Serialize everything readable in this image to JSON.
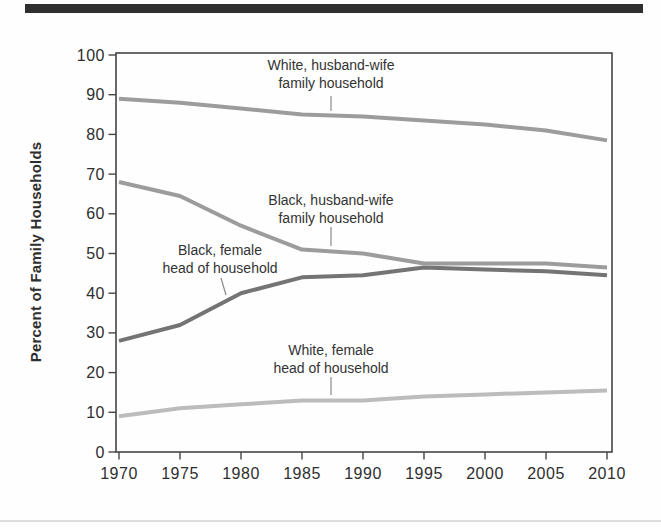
{
  "page": {
    "background": "#fefefe",
    "top_bar_color": "#2f2f2f",
    "bottom_rule_color": "#dddddd"
  },
  "chart_data": {
    "type": "line",
    "title": "",
    "xlabel": "",
    "ylabel": "Percent of Family Households",
    "xlim": [
      1970,
      2010
    ],
    "ylim": [
      0,
      100
    ],
    "grid": false,
    "legend": "inline-labels-with-leader-lines",
    "x": [
      1970,
      1975,
      1980,
      1985,
      1990,
      1995,
      2000,
      2005,
      2010
    ],
    "x_tick_labels": [
      "1970",
      "1975",
      "1980",
      "1985",
      "1990",
      "1995",
      "2000",
      "2005",
      "2010"
    ],
    "y_ticks": [
      0,
      10,
      20,
      30,
      40,
      50,
      60,
      70,
      80,
      90,
      100
    ],
    "y_tick_labels": [
      "0",
      "10",
      "20",
      "30",
      "40",
      "50",
      "60",
      "70",
      "80",
      "90",
      "100"
    ],
    "axis_color": "#454545",
    "text_color": "#2e2e2e",
    "leader_color": "#8a8a8a",
    "series": [
      {
        "name": "White, husband-wife family household",
        "label_lines": [
          "White, husband-wife",
          "family household"
        ],
        "color": "#9c9c9c",
        "values": [
          89,
          88,
          86.5,
          85,
          84.5,
          83.5,
          82.5,
          81,
          78.5
        ]
      },
      {
        "name": "Black, husband-wife family household",
        "label_lines": [
          "Black, husband-wife",
          "family household"
        ],
        "color": "#9c9c9c",
        "values": [
          68,
          64.5,
          57,
          51,
          50,
          47.5,
          47.5,
          47.5,
          46.5
        ]
      },
      {
        "name": "Black, female head of household",
        "label_lines": [
          "Black, female",
          "head of household"
        ],
        "color": "#747474",
        "values": [
          28,
          32,
          40,
          44,
          44.5,
          46.5,
          46,
          45.5,
          44.5
        ]
      },
      {
        "name": "White, female head of household",
        "label_lines": [
          "White, female",
          "head of household"
        ],
        "color": "#bcbcbc",
        "values": [
          9,
          11,
          12,
          13,
          13,
          14,
          14.5,
          15,
          15.5
        ]
      }
    ]
  }
}
